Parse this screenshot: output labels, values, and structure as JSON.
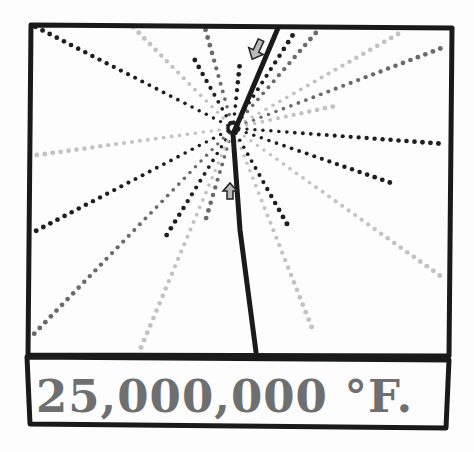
{
  "panel": {
    "caption": "25,000,000 °F.",
    "colors": {
      "ink": "#1a1a1a",
      "dark_dot": "#1e1e1e",
      "mid_dot": "#6a6a6a",
      "light_dot": "#c2c2c2",
      "caption": "#6f6f6f",
      "paper": "#fdfdfd"
    },
    "burst_center": [
      233,
      128
    ],
    "rays": [
      {
        "to": [
          34,
          26
        ],
        "tone": "dark"
      },
      {
        "to": [
          132,
          26
        ],
        "tone": "light"
      },
      {
        "to": [
          205,
          28
        ],
        "tone": "mid"
      },
      {
        "to": [
          192,
          55
        ],
        "tone": "dark"
      },
      {
        "to": [
          240,
          62
        ],
        "tone": "dark"
      },
      {
        "to": [
          296,
          30
        ],
        "tone": "dark"
      },
      {
        "to": [
          320,
          28
        ],
        "tone": "mid"
      },
      {
        "to": [
          405,
          30
        ],
        "tone": "light"
      },
      {
        "to": [
          447,
          46
        ],
        "tone": "mid"
      },
      {
        "to": [
          340,
          105
        ],
        "tone": "light"
      },
      {
        "to": [
          446,
          144
        ],
        "tone": "dark"
      },
      {
        "to": [
          397,
          185
        ],
        "tone": "dark"
      },
      {
        "to": [
          442,
          277
        ],
        "tone": "light"
      },
      {
        "to": [
          312,
          328
        ],
        "tone": "light"
      },
      {
        "to": [
          287,
          224
        ],
        "tone": "dark"
      },
      {
        "to": [
          205,
          222
        ],
        "tone": "mid"
      },
      {
        "to": [
          163,
          241
        ],
        "tone": "dark"
      },
      {
        "to": [
          140,
          350
        ],
        "tone": "light"
      },
      {
        "to": [
          30,
          338
        ],
        "tone": "mid"
      },
      {
        "to": [
          30,
          234
        ],
        "tone": "dark"
      },
      {
        "to": [
          30,
          156
        ],
        "tone": "light"
      }
    ],
    "arrows": [
      {
        "name": "arrow-down-left",
        "at": [
          256,
          51
        ],
        "direction": "down-left"
      },
      {
        "name": "arrow-up",
        "at": [
          230,
          190
        ],
        "direction": "up"
      }
    ]
  }
}
